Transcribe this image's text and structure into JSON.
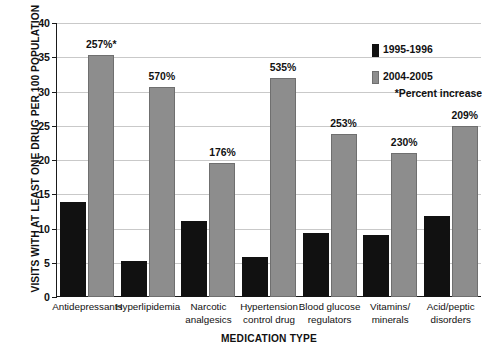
{
  "chart_data": {
    "type": "bar",
    "title": "",
    "xlabel": "MEDICATION TYPE",
    "ylabel": "VISITS WITH AT LEAST ONE DRUG PER 100 POPULATION",
    "ylim": [
      0,
      40
    ],
    "yticks": [
      0,
      5,
      10,
      15,
      20,
      25,
      30,
      35,
      40
    ],
    "ytick_labels": [
      "0",
      "5",
      "10",
      "15",
      "20",
      "25",
      "30",
      "35",
      "40"
    ],
    "grid": true,
    "legend_position": "top-right",
    "categories": [
      "Antidepressants",
      "Hyperlipidemia",
      "Narcotic analgesics",
      "Hypertension control drug",
      "Blood glucose regulators",
      "Vitamins/ minerals",
      "Acid/peptic disorders"
    ],
    "category_lines": [
      [
        "Antidepressants"
      ],
      [
        "Hyperlipidemia"
      ],
      [
        "Narcotic",
        "analgesics"
      ],
      [
        "Hypertension",
        "control drug"
      ],
      [
        "Blood glucose",
        "regulators"
      ],
      [
        "Vitamins/",
        "minerals"
      ],
      [
        "Acid/peptic",
        "disorders"
      ]
    ],
    "series": [
      {
        "name": "1995-1996",
        "color": "#111111",
        "values": [
          13.8,
          5.3,
          11.1,
          5.9,
          9.3,
          9.1,
          11.8
        ]
      },
      {
        "name": "2004-2005",
        "color": "#8d8d8d",
        "values": [
          35.4,
          30.6,
          19.6,
          32.0,
          23.8,
          21.0,
          24.9
        ]
      }
    ],
    "annotations": [
      "257%*",
      "570%",
      "176%",
      "535%",
      "253%",
      "230%",
      "209%"
    ],
    "footnote": "*Percent increase"
  },
  "legend": {
    "series_1_label": "1995-1996",
    "series_2_label": "2004-2005",
    "note": "*Percent increase"
  },
  "axes": {
    "y_title": "VISITS WITH AT LEAST ONE DRUG PER 100 POPULATION",
    "x_title": "MEDICATION TYPE"
  }
}
